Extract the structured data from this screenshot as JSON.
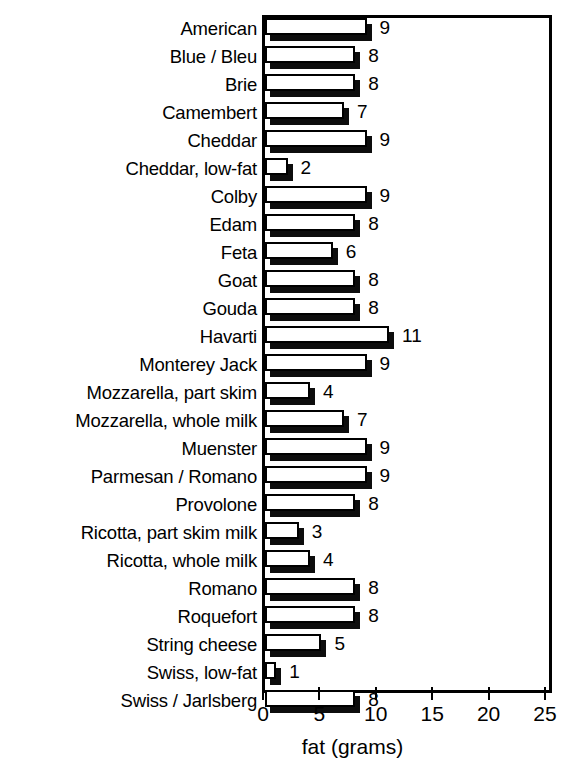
{
  "chart_data": {
    "type": "bar",
    "orientation": "horizontal",
    "title": "",
    "xlabel": "fat (grams)",
    "ylabel": "",
    "xlim": [
      0,
      25
    ],
    "xticks": [
      0,
      5,
      10,
      15,
      20,
      25
    ],
    "xtick_labels": [
      "0",
      "5",
      "10",
      "15",
      "20",
      "25"
    ],
    "grid": false,
    "legend": null,
    "value_labels": true,
    "bar_style": "white-fill-black-outline-with-black-drop-shadow",
    "categories": [
      "American",
      "Blue / Bleu",
      "Brie",
      "Camembert",
      "Cheddar",
      "Cheddar, low-fat",
      "Colby",
      "Edam",
      "Feta",
      "Goat",
      "Gouda",
      "Havarti",
      "Monterey Jack",
      "Mozzarella, part skim",
      "Mozzarella, whole milk",
      "Muenster",
      "Parmesan / Romano",
      "Provolone",
      "Ricotta, part skim milk",
      "Ricotta, whole milk",
      "Romano",
      "Roquefort",
      "String cheese",
      "Swiss, low-fat",
      "Swiss / Jarlsberg"
    ],
    "values": [
      9,
      8,
      8,
      7,
      9,
      2,
      9,
      8,
      6,
      8,
      8,
      11,
      9,
      4,
      7,
      9,
      9,
      8,
      3,
      4,
      8,
      8,
      5,
      1,
      8
    ],
    "labels": [
      "9",
      "8",
      "8",
      "7",
      "9",
      "2",
      "9",
      "8",
      "6",
      "8",
      "8",
      "11",
      "9",
      "4",
      "7",
      "9",
      "9",
      "8",
      "3",
      "4",
      "8",
      "8",
      "5",
      "1",
      "8"
    ]
  },
  "colors": {
    "bar_fill": "#ffffff",
    "bar_outline": "#000000",
    "bar_shadow": "#0d0d0d",
    "axis": "#000000",
    "text": "#000000",
    "background": "#ffffff"
  }
}
